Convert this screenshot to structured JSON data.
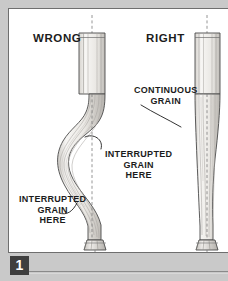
{
  "figure": {
    "number": "1",
    "headers": {
      "wrong": "WRONG",
      "right": "RIGHT"
    },
    "callouts": {
      "continuous": [
        "CONTINUOUS",
        "GRAIN"
      ],
      "interrupted_center": [
        "INTERRUPTED",
        "GRAIN",
        "HERE"
      ],
      "interrupted_left": [
        "INTERRUPTED",
        "GRAIN",
        "HERE"
      ]
    },
    "caption_fragment": ""
  },
  "colors": {
    "page_background": "#c9c9c9",
    "panel_background": "#ffffff",
    "panel_border": "#6e6e6e",
    "ink": "#1c1c1c",
    "badge_background": "#3f3f3f",
    "badge_text": "#ffffff",
    "wood_light": "#f4f2ef",
    "wood_shade": "#bdbab5",
    "grain_line": "#9b9893",
    "rule": "#8a8a8a"
  }
}
